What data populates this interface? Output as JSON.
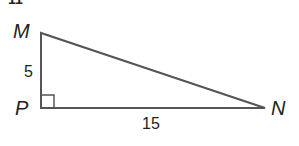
{
  "problem_number_fragment": "11",
  "triangle": {
    "vertices": {
      "M": {
        "label": "M"
      },
      "P": {
        "label": "P"
      },
      "N": {
        "label": "N"
      }
    },
    "right_angle_at": "P",
    "sides": {
      "MP": {
        "label": "5"
      },
      "PN": {
        "label": "15"
      }
    },
    "stroke_color": "#555555",
    "label_color": "#222222"
  }
}
